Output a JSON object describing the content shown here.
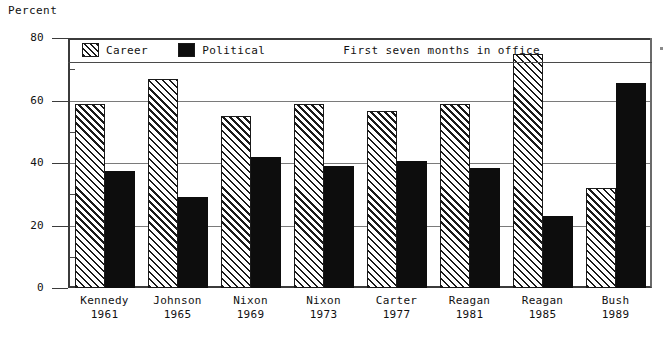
{
  "chart_data": {
    "type": "bar",
    "title": "",
    "xlabel": "",
    "ylabel": "Percent",
    "ylim": [
      0,
      80
    ],
    "yticks": [
      0,
      20,
      40,
      60,
      80
    ],
    "ytick_labels": [
      "0",
      "20",
      "40",
      "60",
      "80"
    ],
    "minor_tick_interval": 10,
    "grid": true,
    "legend_position": "top-inside",
    "annotation": "First seven months in office",
    "categories": [
      "Kennedy 1961",
      "Johnson 1965",
      "Nixon 1969",
      "Nixon 1973",
      "Carter 1977",
      "Reagan 1981",
      "Reagan 1985",
      "Bush 1989"
    ],
    "category_names": [
      "Kennedy",
      "Johnson",
      "Nixon",
      "Nixon",
      "Carter",
      "Reagan",
      "Reagan",
      "Bush"
    ],
    "category_years": [
      "1961",
      "1965",
      "1969",
      "1973",
      "1977",
      "1981",
      "1985",
      "1989"
    ],
    "series": [
      {
        "name": "Career",
        "values": [
          59,
          67,
          55,
          59,
          56.5,
          59,
          75,
          32
        ]
      },
      {
        "name": "Political",
        "values": [
          37.5,
          29,
          42,
          39,
          40.5,
          38.5,
          23,
          65.5
        ]
      }
    ]
  },
  "axis": {
    "y_title": "Percent"
  },
  "legend": {
    "career_label": "Career",
    "political_label": "Political",
    "note": "First seven months in office"
  }
}
